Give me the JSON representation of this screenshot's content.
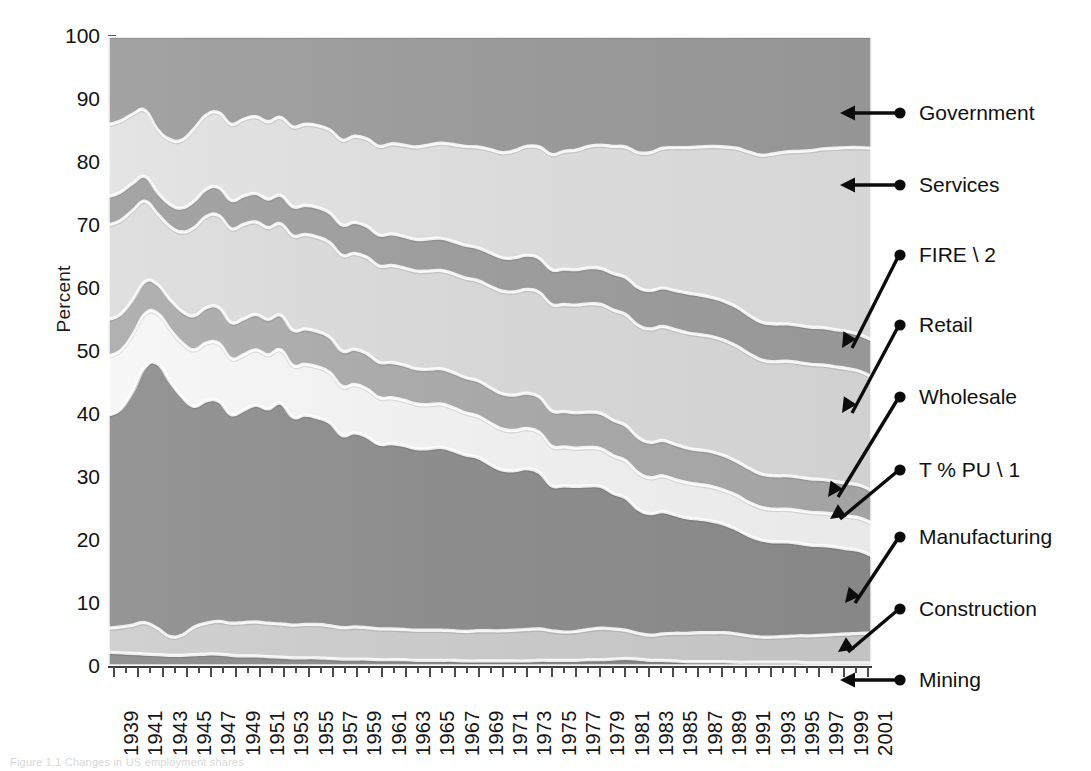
{
  "figure": {
    "caption": "Figure 1.1 Changes in US employment shares"
  },
  "axes": {
    "ylabel": "Percent",
    "yticks": [
      "0",
      "10",
      "20",
      "30",
      "40",
      "50",
      "60",
      "70",
      "80",
      "90",
      "100"
    ],
    "xtick_labels": [
      "1939",
      "1941",
      "1943",
      "1945",
      "1947",
      "1949",
      "1951",
      "1953",
      "1955",
      "1957",
      "1959",
      "1961",
      "1963",
      "1965",
      "1967",
      "1969",
      "1971",
      "1973",
      "1975",
      "1977",
      "1979",
      "1981",
      "1983",
      "1985",
      "1987",
      "1989",
      "1991",
      "1993",
      "1995",
      "1997",
      "1999",
      "2001"
    ]
  },
  "callouts": [
    {
      "label": "Government",
      "kind": "horizontal"
    },
    {
      "label": "Services",
      "kind": "horizontal"
    },
    {
      "label": "FIRE \\ 2",
      "kind": "diagonal"
    },
    {
      "label": "Retail",
      "kind": "diagonal"
    },
    {
      "label": "Wholesale",
      "kind": "diagonal"
    },
    {
      "label": "T % PU \\ 1",
      "kind": "diagonal"
    },
    {
      "label": "Manufacturing",
      "kind": "diagonal"
    },
    {
      "label": "Construction",
      "kind": "diagonal"
    },
    {
      "label": "Mining",
      "kind": "horizontal"
    }
  ],
  "chart_data": {
    "type": "area",
    "stacked": true,
    "normalized": true,
    "title": "",
    "xlabel": "",
    "ylabel": "Percent",
    "ylim": [
      0,
      100
    ],
    "xlim": [
      1939,
      2001
    ],
    "grid": false,
    "legend_position": "right-callouts",
    "x": [
      1939,
      1940,
      1941,
      1942,
      1943,
      1944,
      1945,
      1946,
      1947,
      1948,
      1949,
      1950,
      1951,
      1952,
      1953,
      1954,
      1955,
      1956,
      1957,
      1958,
      1959,
      1960,
      1961,
      1962,
      1963,
      1964,
      1965,
      1966,
      1967,
      1968,
      1969,
      1970,
      1971,
      1972,
      1973,
      1974,
      1975,
      1976,
      1977,
      1978,
      1979,
      1980,
      1981,
      1982,
      1983,
      1984,
      1985,
      1986,
      1987,
      1988,
      1989,
      1990,
      1991,
      1992,
      1993,
      1994,
      1995,
      1996,
      1997,
      1998,
      1999,
      2000,
      2001
    ],
    "series": [
      {
        "name": "Mining",
        "color": "#8a8a8a",
        "values": [
          2.2,
          2.1,
          2.0,
          1.9,
          1.8,
          1.7,
          1.7,
          1.8,
          1.9,
          1.9,
          1.7,
          1.6,
          1.6,
          1.5,
          1.4,
          1.3,
          1.3,
          1.3,
          1.2,
          1.1,
          1.1,
          1.1,
          1.0,
          1.0,
          1.0,
          0.9,
          0.9,
          0.9,
          0.9,
          0.8,
          0.8,
          0.8,
          0.8,
          0.8,
          0.8,
          0.9,
          0.9,
          0.9,
          0.9,
          1.0,
          1.0,
          1.1,
          1.2,
          1.1,
          0.9,
          0.9,
          0.8,
          0.7,
          0.7,
          0.7,
          0.7,
          0.6,
          0.6,
          0.6,
          0.6,
          0.6,
          0.6,
          0.5,
          0.5,
          0.5,
          0.5,
          0.5,
          0.5
        ]
      },
      {
        "name": "Construction",
        "color": "#c9c9c9",
        "values": [
          3.8,
          4.1,
          4.5,
          5.0,
          4.2,
          3.0,
          3.2,
          4.4,
          4.9,
          5.2,
          5.1,
          5.3,
          5.4,
          5.3,
          5.3,
          5.2,
          5.3,
          5.3,
          5.2,
          5.0,
          5.1,
          5.0,
          4.9,
          4.9,
          4.8,
          4.8,
          4.8,
          4.8,
          4.7,
          4.7,
          4.8,
          4.8,
          4.8,
          4.9,
          5.0,
          5.0,
          4.7,
          4.5,
          4.6,
          4.8,
          5.0,
          4.8,
          4.5,
          4.1,
          4.0,
          4.2,
          4.4,
          4.5,
          4.6,
          4.6,
          4.6,
          4.5,
          4.2,
          4.0,
          4.0,
          4.1,
          4.2,
          4.3,
          4.4,
          4.5,
          4.6,
          4.7,
          4.7
        ]
      },
      {
        "name": "Manufacturing",
        "color": "#8d8d8d",
        "values": [
          33.8,
          34.5,
          37.0,
          40.5,
          42.0,
          40.5,
          37.8,
          35.0,
          35.3,
          34.9,
          33.1,
          33.7,
          34.4,
          34.0,
          35.0,
          33.0,
          33.2,
          32.8,
          32.2,
          30.5,
          30.8,
          30.3,
          29.3,
          29.4,
          29.2,
          28.8,
          28.8,
          29.0,
          28.6,
          28.0,
          27.5,
          26.4,
          25.5,
          25.3,
          25.5,
          24.8,
          23.0,
          23.2,
          23.0,
          22.8,
          22.5,
          21.5,
          21.0,
          19.7,
          19.3,
          19.4,
          18.8,
          18.3,
          18.0,
          17.7,
          17.2,
          16.6,
          15.9,
          15.4,
          15.1,
          15.0,
          14.7,
          14.4,
          14.2,
          13.9,
          13.5,
          13.1,
          12.3
        ]
      },
      {
        "name": "T % PU \\ 1",
        "color": "#efefef",
        "values": [
          9.4,
          9.3,
          9.0,
          8.5,
          8.0,
          8.3,
          8.6,
          9.0,
          9.2,
          9.2,
          8.9,
          8.8,
          8.8,
          8.6,
          8.5,
          8.2,
          8.1,
          8.1,
          8.0,
          7.8,
          7.7,
          7.6,
          7.4,
          7.3,
          7.2,
          7.1,
          7.0,
          6.9,
          6.8,
          6.7,
          6.6,
          6.6,
          6.5,
          6.4,
          6.4,
          6.4,
          6.3,
          6.2,
          6.1,
          6.1,
          6.0,
          6.0,
          5.9,
          5.8,
          5.7,
          5.7,
          5.6,
          5.6,
          5.5,
          5.5,
          5.4,
          5.4,
          5.3,
          5.2,
          5.2,
          5.2,
          5.2,
          5.2,
          5.2,
          5.2,
          5.2,
          5.2,
          5.2
        ]
      },
      {
        "name": "Wholesale",
        "color": "#a9a9a9",
        "values": [
          5.8,
          5.8,
          5.6,
          5.1,
          4.6,
          4.7,
          5.0,
          5.4,
          5.6,
          5.7,
          5.7,
          5.7,
          5.6,
          5.6,
          5.5,
          5.6,
          5.6,
          5.6,
          5.6,
          5.6,
          5.6,
          5.6,
          5.6,
          5.6,
          5.6,
          5.6,
          5.6,
          5.6,
          5.6,
          5.6,
          5.6,
          5.6,
          5.6,
          5.6,
          5.6,
          5.6,
          5.6,
          5.6,
          5.6,
          5.6,
          5.6,
          5.6,
          5.6,
          5.6,
          5.6,
          5.6,
          5.6,
          5.5,
          5.5,
          5.5,
          5.5,
          5.4,
          5.4,
          5.3,
          5.3,
          5.3,
          5.3,
          5.3,
          5.3,
          5.2,
          5.2,
          5.2,
          5.1
        ]
      },
      {
        "name": "Retail",
        "color": "#d7d7d7",
        "values": [
          15.0,
          14.9,
          14.2,
          12.8,
          11.2,
          11.6,
          12.6,
          14.0,
          14.5,
          14.6,
          14.9,
          15.0,
          14.7,
          14.6,
          14.5,
          15.0,
          15.0,
          15.0,
          15.0,
          15.2,
          15.2,
          15.3,
          15.3,
          15.4,
          15.4,
          15.5,
          15.6,
          15.6,
          15.7,
          15.8,
          15.9,
          16.1,
          16.3,
          16.4,
          16.5,
          16.6,
          16.9,
          17.0,
          17.1,
          17.2,
          17.3,
          17.5,
          17.6,
          17.8,
          18.0,
          18.1,
          18.2,
          18.3,
          18.3,
          18.3,
          18.3,
          18.3,
          18.2,
          18.1,
          18.1,
          18.2,
          18.2,
          18.2,
          18.2,
          18.2,
          18.2,
          18.1,
          18.1
        ]
      },
      {
        "name": "FIRE \\ 2",
        "color": "#9d9d9d",
        "values": [
          4.5,
          4.5,
          4.3,
          3.9,
          3.4,
          3.5,
          3.8,
          4.2,
          4.3,
          4.4,
          4.5,
          4.5,
          4.5,
          4.5,
          4.5,
          4.6,
          4.6,
          4.7,
          4.7,
          4.8,
          4.9,
          4.9,
          4.9,
          5.0,
          5.0,
          5.0,
          5.1,
          5.1,
          5.1,
          5.2,
          5.2,
          5.3,
          5.3,
          5.4,
          5.4,
          5.4,
          5.5,
          5.6,
          5.6,
          5.7,
          5.7,
          5.8,
          5.9,
          6.0,
          6.1,
          6.1,
          6.2,
          6.3,
          6.3,
          6.2,
          6.2,
          6.2,
          6.1,
          6.0,
          6.0,
          5.9,
          5.9,
          5.9,
          5.9,
          5.9,
          5.9,
          5.8,
          5.8
        ]
      },
      {
        "name": "Services",
        "color": "#dcdcdc",
        "values": [
          11.4,
          11.3,
          11.0,
          10.5,
          10.0,
          10.3,
          10.8,
          11.5,
          11.8,
          11.9,
          12.1,
          12.2,
          12.2,
          12.3,
          12.4,
          12.7,
          12.9,
          13.0,
          13.2,
          13.5,
          13.7,
          13.9,
          14.1,
          14.3,
          14.5,
          14.7,
          14.9,
          15.1,
          15.4,
          15.7,
          16.0,
          16.4,
          16.7,
          17.0,
          17.3,
          17.7,
          18.3,
          18.7,
          19.0,
          19.3,
          19.6,
          20.2,
          20.7,
          21.4,
          21.9,
          22.2,
          22.7,
          23.1,
          23.5,
          24.0,
          24.5,
          25.2,
          25.9,
          26.5,
          27.0,
          27.3,
          27.6,
          28.0,
          28.4,
          28.8,
          29.2,
          29.7,
          30.5
        ]
      },
      {
        "name": "Government",
        "color": "#9b9b9b",
        "values": [
          14.1,
          13.5,
          12.4,
          11.8,
          14.8,
          16.4,
          16.5,
          14.7,
          12.5,
          12.2,
          14.0,
          13.2,
          12.8,
          13.6,
          12.9,
          14.4,
          14.0,
          14.2,
          14.9,
          16.5,
          15.9,
          16.3,
          17.5,
          17.1,
          17.3,
          17.6,
          17.3,
          17.0,
          17.2,
          17.5,
          17.6,
          18.0,
          18.5,
          18.2,
          17.5,
          17.6,
          18.8,
          18.3,
          18.1,
          17.5,
          17.3,
          17.5,
          17.6,
          18.5,
          18.5,
          17.8,
          17.7,
          17.7,
          17.6,
          17.5,
          17.6,
          17.8,
          18.4,
          18.9,
          18.7,
          18.4,
          18.3,
          18.2,
          17.9,
          17.8,
          17.7,
          17.7,
          17.8
        ]
      }
    ]
  }
}
